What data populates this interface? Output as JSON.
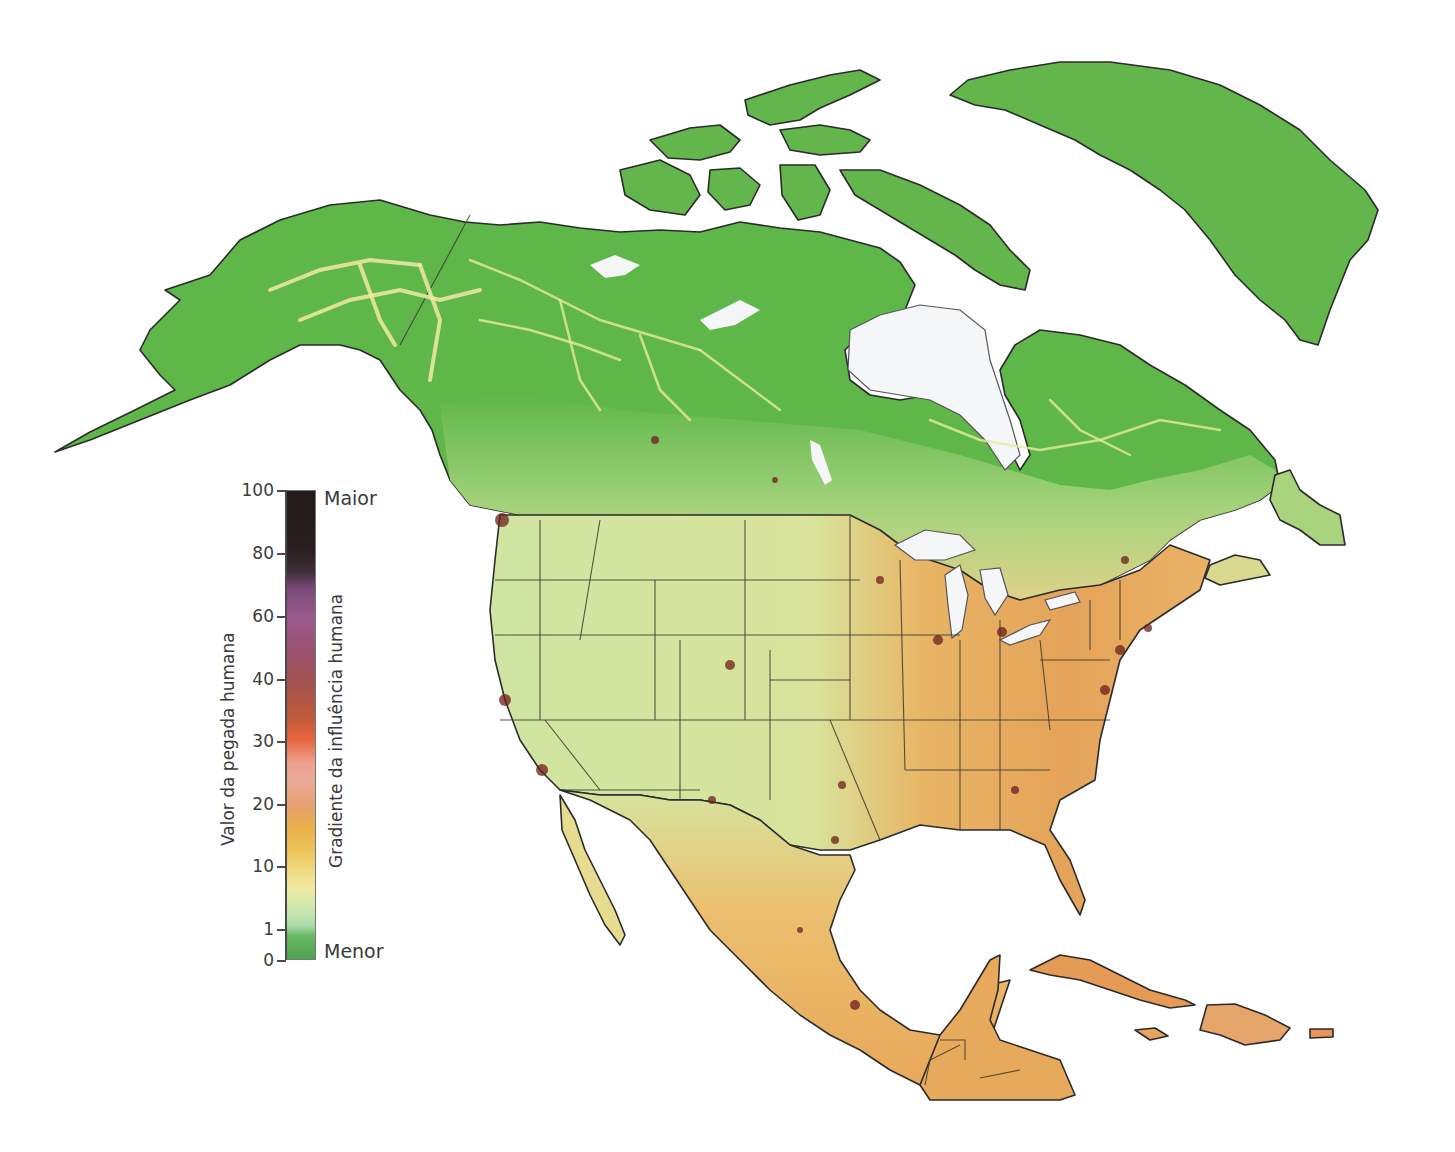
{
  "map": {
    "region": "North America",
    "description": "Human footprint / human influence gradient map",
    "colors": {
      "background": "#ffffff",
      "water": "#f4f6f7",
      "wilderness_green": "#5fb74a",
      "low_influence_lightgreen": "#c6e4a0",
      "medium_yellow": "#f0e295",
      "medium_orange": "#eab04a",
      "high_red": "#c45a32",
      "very_high_dark": "#6b1f1b",
      "borders": "#2b2b2b"
    }
  },
  "legend": {
    "left_axis_title": "Valor da pegada humana",
    "right_axis_title": "Gradiente da influência humana",
    "top_label": "Maior",
    "bottom_label": "Menor",
    "ticks": [
      {
        "value": "100",
        "y": 490
      },
      {
        "value": "80",
        "y": 553
      },
      {
        "value": "60",
        "y": 616
      },
      {
        "value": "40",
        "y": 679
      },
      {
        "value": "30",
        "y": 741
      },
      {
        "value": "20",
        "y": 804
      },
      {
        "value": "10",
        "y": 866
      },
      {
        "value": "1",
        "y": 929
      },
      {
        "value": "0",
        "y": 960
      }
    ],
    "color_stops": [
      {
        "value": 100,
        "color": "#231a1a"
      },
      {
        "value": 85,
        "color": "#2a1e1f"
      },
      {
        "value": 78,
        "color": "#7a4a78"
      },
      {
        "value": 70,
        "color": "#9b5a8f"
      },
      {
        "value": 55,
        "color": "#a3524f"
      },
      {
        "value": 42,
        "color": "#e7643d"
      },
      {
        "value": 36,
        "color": "#eea08d"
      },
      {
        "value": 30,
        "color": "#e7a070"
      },
      {
        "value": 22,
        "color": "#eab04a"
      },
      {
        "value": 15,
        "color": "#efdf88"
      },
      {
        "value": 10,
        "color": "#f1eaa4"
      },
      {
        "value": 5,
        "color": "#bfe2b0"
      },
      {
        "value": 1,
        "color": "#69b763"
      },
      {
        "value": 0,
        "color": "#4ca24e"
      }
    ]
  }
}
